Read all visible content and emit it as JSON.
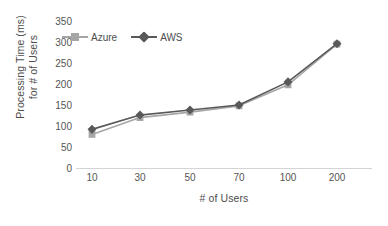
{
  "chart_data": {
    "type": "line",
    "title": "",
    "xlabel": "# of Users",
    "ylabel_line1": "Processing Time (ms)",
    "ylabel_line2": "for # of Users",
    "categories": [
      "10",
      "30",
      "50",
      "70",
      "100",
      "200"
    ],
    "yticks": [
      "0",
      "50",
      "100",
      "150",
      "200",
      "250",
      "300",
      "350"
    ],
    "ylim": [
      0,
      350
    ],
    "grid": false,
    "legend_position": "top-left",
    "series": [
      {
        "name": "Azure",
        "color": "#a6a6a6",
        "marker": "square",
        "values": [
          80,
          120,
          133,
          148,
          198,
          295
        ]
      },
      {
        "name": "AWS",
        "color": "#595959",
        "marker": "diamond",
        "values": [
          92,
          126,
          138,
          150,
          205,
          296
        ]
      }
    ]
  }
}
